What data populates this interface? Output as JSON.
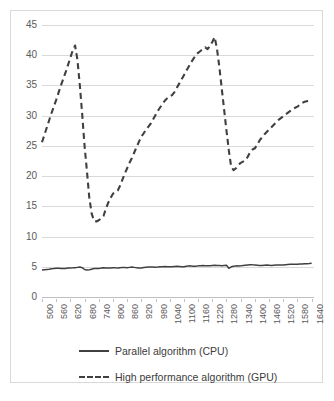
{
  "chart_data": {
    "type": "line",
    "title": "",
    "xlabel": "",
    "ylabel": "",
    "xlim": [
      500,
      1650
    ],
    "ylim": [
      0,
      45
    ],
    "grid": true,
    "legend_position": "bottom",
    "y_ticks": [
      0,
      5,
      10,
      15,
      20,
      25,
      30,
      35,
      40,
      45
    ],
    "x_tick_labels": [
      "500",
      "560",
      "620",
      "680",
      "740",
      "800",
      "860",
      "920",
      "980",
      "1040",
      "1100",
      "1160",
      "1220",
      "1280",
      "1340",
      "1400",
      "1460",
      "1520",
      "1580",
      "1640"
    ],
    "x": [
      500,
      510,
      520,
      530,
      540,
      550,
      560,
      570,
      580,
      590,
      600,
      610,
      620,
      630,
      640,
      650,
      660,
      670,
      680,
      690,
      700,
      710,
      720,
      730,
      740,
      750,
      760,
      770,
      780,
      790,
      800,
      810,
      820,
      830,
      840,
      850,
      860,
      870,
      880,
      890,
      900,
      910,
      920,
      930,
      940,
      950,
      960,
      970,
      980,
      990,
      1000,
      1010,
      1020,
      1030,
      1040,
      1050,
      1060,
      1070,
      1080,
      1090,
      1100,
      1110,
      1120,
      1130,
      1140,
      1150,
      1160,
      1170,
      1180,
      1190,
      1200,
      1210,
      1220,
      1230,
      1240,
      1250,
      1260,
      1270,
      1280,
      1290,
      1300,
      1310,
      1320,
      1330,
      1340,
      1350,
      1360,
      1370,
      1380,
      1390,
      1400,
      1410,
      1420,
      1430,
      1440,
      1450,
      1460,
      1470,
      1480,
      1490,
      1500,
      1510,
      1520,
      1530,
      1540,
      1550,
      1560,
      1570,
      1580,
      1590,
      1600,
      1610,
      1620,
      1630,
      1640
    ],
    "series": [
      {
        "name": "Parallel algorithm (CPU)",
        "style": "solid",
        "color": "#404040",
        "values": [
          4.45,
          4.5,
          4.55,
          4.6,
          4.68,
          4.7,
          4.75,
          4.74,
          4.72,
          4.7,
          4.72,
          4.78,
          4.8,
          4.82,
          4.85,
          4.9,
          4.95,
          4.85,
          4.55,
          4.48,
          4.5,
          4.6,
          4.7,
          4.72,
          4.7,
          4.78,
          4.82,
          4.8,
          4.78,
          4.8,
          4.85,
          4.82,
          4.8,
          4.85,
          4.9,
          4.88,
          4.85,
          4.9,
          4.95,
          4.9,
          4.82,
          4.78,
          4.8,
          4.88,
          4.92,
          4.95,
          4.98,
          4.95,
          4.92,
          4.95,
          5.0,
          5.02,
          5.05,
          5.02,
          5.0,
          5.02,
          5.05,
          5.08,
          5.05,
          5.0,
          5.02,
          5.08,
          5.15,
          5.12,
          5.08,
          5.1,
          5.15,
          5.18,
          5.2,
          5.18,
          5.15,
          5.18,
          5.22,
          5.25,
          5.22,
          5.2,
          5.18,
          5.22,
          5.25,
          4.75,
          5.0,
          5.1,
          5.15,
          5.12,
          5.15,
          5.2,
          5.25,
          5.3,
          5.35,
          5.32,
          5.3,
          5.25,
          5.2,
          5.22,
          5.25,
          5.28,
          5.25,
          5.22,
          5.25,
          5.28,
          5.3,
          5.28,
          5.3,
          5.35,
          5.38,
          5.4,
          5.42,
          5.4,
          5.42,
          5.45,
          5.48,
          5.5,
          5.52,
          5.55,
          5.6
        ]
      },
      {
        "name": "High performance algorithm (GPU)",
        "style": "dashed",
        "color": "#404040",
        "values": [
          25.6,
          26.8,
          28.0,
          29.2,
          30.4,
          31.5,
          32.6,
          33.8,
          35.0,
          36.1,
          37.2,
          38.4,
          39.6,
          40.8,
          41.6,
          39.2,
          35.0,
          30.2,
          25.0,
          20.8,
          16.4,
          13.8,
          12.6,
          12.5,
          12.7,
          13.0,
          13.4,
          14.6,
          15.6,
          16.4,
          17.1,
          17.3,
          17.6,
          18.4,
          19.4,
          20.4,
          21.3,
          22.2,
          23.0,
          23.9,
          24.8,
          25.7,
          26.5,
          27.1,
          27.7,
          28.2,
          28.7,
          29.4,
          30.1,
          30.8,
          31.4,
          32.0,
          32.5,
          32.9,
          33.2,
          33.4,
          33.9,
          34.6,
          35.3,
          36.0,
          36.7,
          37.4,
          38.1,
          38.8,
          39.4,
          40.0,
          40.4,
          40.7,
          41.0,
          41.3,
          41.0,
          41.5,
          42.2,
          43.0,
          41.0,
          38.0,
          34.5,
          31.0,
          27.5,
          24.2,
          21.5,
          21.0,
          21.3,
          21.8,
          22.2,
          22.4,
          22.6,
          23.2,
          24.0,
          24.4,
          24.6,
          25.2,
          25.9,
          26.4,
          26.9,
          27.3,
          27.7,
          28.1,
          28.5,
          28.9,
          29.3,
          29.6,
          29.9,
          30.2,
          30.5,
          30.8,
          31.1,
          31.3,
          31.5,
          31.8,
          32.1,
          32.3,
          32.4,
          32.45,
          32.5
        ]
      }
    ]
  },
  "legend": {
    "items": [
      {
        "label": "Parallel algorithm (CPU)",
        "style": "solid"
      },
      {
        "label": "High performance algorithm (GPU)",
        "style": "dashed"
      }
    ]
  },
  "colors": {
    "line": "#404040",
    "gridline": "#d9d9d9",
    "axis": "#bfbfbf",
    "tick_text": "#5a5a5a",
    "legend_text": "#3b3b3b",
    "frame": "#d9d9d9",
    "background": "#ffffff"
  }
}
